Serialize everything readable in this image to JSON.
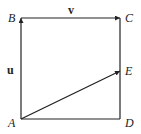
{
  "diagram": {
    "type": "vector-geometry",
    "points": {
      "A": {
        "label": "A",
        "x": 21,
        "y": 119
      },
      "B": {
        "label": "B",
        "x": 21,
        "y": 18
      },
      "C": {
        "label": "C",
        "x": 120,
        "y": 18
      },
      "D": {
        "label": "D",
        "x": 120,
        "y": 119
      },
      "E": {
        "label": "E",
        "x": 120,
        "y": 71
      }
    },
    "vectors": {
      "u": {
        "label": "u",
        "from": "A",
        "to": "B"
      },
      "v": {
        "label": "v",
        "from": "B",
        "to": "C"
      },
      "AE": {
        "from": "A",
        "to": "E"
      }
    },
    "segments": [
      [
        "C",
        "D"
      ],
      [
        "A",
        "D"
      ]
    ],
    "colors": {
      "stroke": "#222222",
      "background": "#ffffff"
    }
  }
}
